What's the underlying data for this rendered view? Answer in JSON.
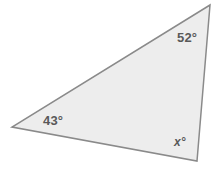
{
  "figure": {
    "name": "triangle-angle-diagram",
    "width": 218,
    "height": 173,
    "background_color": "#ffffff",
    "shape": {
      "type": "triangle",
      "fill_color": "#ededed",
      "stroke_color": "#8a8a8a",
      "stroke_width": 1.5,
      "vertices": [
        {
          "name": "top-vertex",
          "x": 210,
          "y": 5
        },
        {
          "name": "left-vertex",
          "x": 12,
          "y": 127
        },
        {
          "name": "bottom-right-vertex",
          "x": 197,
          "y": 161
        }
      ]
    },
    "labels": {
      "text_color": "#595959",
      "top": "52°",
      "left": "43°",
      "bottom_right": "x°"
    }
  }
}
